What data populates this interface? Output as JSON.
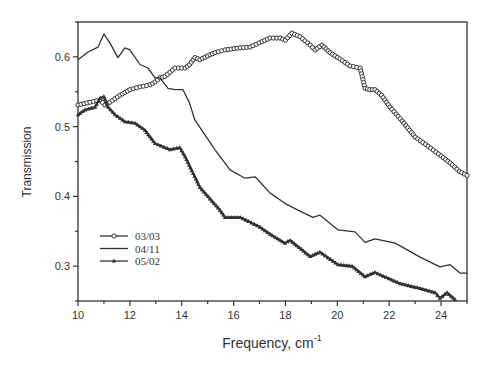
{
  "chart_data": {
    "type": "line",
    "title": "",
    "xlabel": "Frequency, cm",
    "xlabel_superscript": "-1",
    "ylabel": "Transmission",
    "xlim": [
      10,
      25
    ],
    "ylim": [
      0.25,
      0.65
    ],
    "xticks": [
      10,
      12,
      14,
      16,
      18,
      20,
      22,
      24
    ],
    "xtick_labels": [
      "10",
      "12",
      "14",
      "16",
      "18",
      "20",
      "22",
      "24"
    ],
    "xminor_step": 1,
    "yticks": [
      0.3,
      0.4,
      0.5,
      0.6
    ],
    "ytick_labels": [
      "0.3",
      "0.4",
      "0.5",
      "0.6"
    ],
    "yminor_step": 0.05,
    "grid": false,
    "legend_position": "lower-left",
    "color": "#333333",
    "series": [
      {
        "name": "03/03",
        "marker": "circle",
        "x": [
          10.0,
          10.46,
          10.85,
          11.04,
          11.23,
          11.62,
          12.0,
          12.39,
          12.78,
          12.97,
          13.16,
          13.35,
          13.74,
          14.13,
          14.3,
          14.51,
          14.7,
          15.09,
          15.28,
          15.67,
          16.25,
          16.63,
          17.1,
          17.4,
          17.79,
          18.0,
          18.25,
          18.56,
          18.95,
          19.14,
          19.41,
          19.72,
          20.1,
          20.49,
          20.88,
          21.07,
          21.25,
          21.45,
          21.7,
          22.03,
          22.5,
          23.0,
          23.5,
          24.0,
          24.35,
          24.7,
          25.0
        ],
        "y": [
          0.531,
          0.535,
          0.538,
          0.531,
          0.535,
          0.545,
          0.553,
          0.557,
          0.56,
          0.564,
          0.57,
          0.572,
          0.584,
          0.584,
          0.589,
          0.599,
          0.596,
          0.603,
          0.606,
          0.61,
          0.613,
          0.614,
          0.622,
          0.627,
          0.627,
          0.624,
          0.634,
          0.629,
          0.617,
          0.61,
          0.617,
          0.606,
          0.597,
          0.587,
          0.584,
          0.555,
          0.553,
          0.553,
          0.545,
          0.528,
          0.508,
          0.485,
          0.472,
          0.458,
          0.448,
          0.436,
          0.43
        ]
      },
      {
        "name": "04/11",
        "marker": "plus",
        "x": [
          10.0,
          10.39,
          10.77,
          11.0,
          11.23,
          11.54,
          11.81,
          12.0,
          12.39,
          12.7,
          12.97,
          13.16,
          13.47,
          13.74,
          14.05,
          14.3,
          14.5,
          15.28,
          15.86,
          16.44,
          16.83,
          17.4,
          17.98,
          18.5,
          19.06,
          19.33,
          20.03,
          20.68,
          21.07,
          21.45,
          22.23,
          23.19,
          23.96,
          24.35,
          24.73,
          25.0
        ],
        "y": [
          0.596,
          0.607,
          0.614,
          0.633,
          0.62,
          0.599,
          0.613,
          0.61,
          0.589,
          0.584,
          0.57,
          0.57,
          0.555,
          0.553,
          0.553,
          0.534,
          0.51,
          0.467,
          0.438,
          0.426,
          0.428,
          0.405,
          0.39,
          0.38,
          0.37,
          0.373,
          0.352,
          0.349,
          0.334,
          0.339,
          0.333,
          0.313,
          0.299,
          0.302,
          0.29,
          0.29
        ]
      },
      {
        "name": "05/02",
        "marker": "triangle",
        "x": [
          10.0,
          10.27,
          10.66,
          10.85,
          11.0,
          11.16,
          11.43,
          11.81,
          12.2,
          12.58,
          12.97,
          13.55,
          13.93,
          14.13,
          14.7,
          15.48,
          15.67,
          16.25,
          17.02,
          17.4,
          17.98,
          18.18,
          18.95,
          19.33,
          20.03,
          20.57,
          21.07,
          21.45,
          22.42,
          23.19,
          23.77,
          23.96,
          24.23,
          24.54
        ],
        "y": [
          0.517,
          0.524,
          0.528,
          0.541,
          0.543,
          0.528,
          0.517,
          0.507,
          0.505,
          0.495,
          0.476,
          0.467,
          0.47,
          0.457,
          0.413,
          0.38,
          0.37,
          0.37,
          0.356,
          0.346,
          0.333,
          0.337,
          0.314,
          0.32,
          0.302,
          0.3,
          0.285,
          0.291,
          0.275,
          0.268,
          0.262,
          0.254,
          0.262,
          0.252
        ]
      }
    ]
  }
}
